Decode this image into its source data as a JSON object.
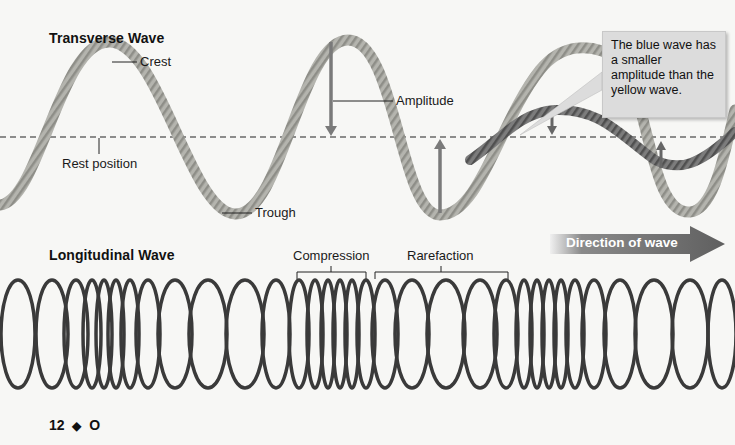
{
  "transverse": {
    "title": "Transverse Wave",
    "labels": {
      "crest": "Crest",
      "amplitude": "Amplitude",
      "rest_position": "Rest position",
      "trough": "Trough"
    },
    "callout": "The blue wave has a smaller amplitude than the yellow wave.",
    "direction": "Direction of wave",
    "colors": {
      "large_wave": "#a9a9a4",
      "small_wave": "#6c6c6c",
      "arrow": "#7a7a7a",
      "direction_arrow": "#6d6d6d"
    }
  },
  "longitudinal": {
    "title": "Longitudinal Wave",
    "labels": {
      "compression": "Compression",
      "rarefaction": "Rarefaction"
    },
    "coil_color": "#3a3a3a"
  },
  "footer": {
    "page_number": "12",
    "separator": "◆",
    "section": "O"
  }
}
